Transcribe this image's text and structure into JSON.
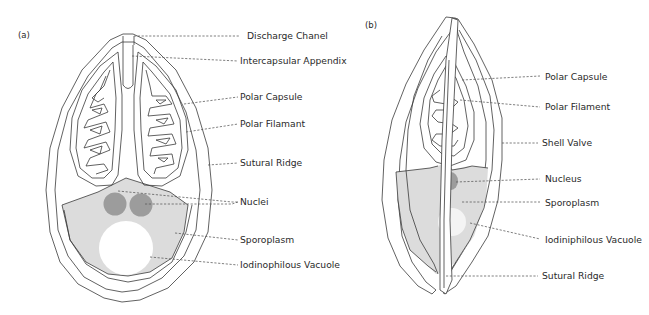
{
  "figure": {
    "panels": [
      {
        "id": "a",
        "label": "(a)",
        "annotations": [
          {
            "text": "Discharge Chanel"
          },
          {
            "text": "Intercapsular Appendix"
          },
          {
            "text": "Polar Capsule"
          },
          {
            "text": "Polar Filamant"
          },
          {
            "text": "Sutural Ridge"
          },
          {
            "text": "Nuclei"
          },
          {
            "text": "Sporoplasm"
          },
          {
            "text": "Iodinophilous Vacuole"
          }
        ]
      },
      {
        "id": "b",
        "label": "(b)",
        "annotations": [
          {
            "text": "Polar Capsule"
          },
          {
            "text": "Polar Filament"
          },
          {
            "text": "Shell Valve"
          },
          {
            "text": "Nucleus"
          },
          {
            "text": "Sporoplasm"
          },
          {
            "text": "Iodiniphilous Vacuole"
          },
          {
            "text": "Sutural Ridge"
          }
        ]
      }
    ],
    "colors": {
      "line": "#3a3a3a",
      "sporoplasm": "#dcdcdc",
      "nucleus": "#9c9c9c",
      "vacuole": "#ffffff",
      "text": "#2a2a2a"
    }
  }
}
